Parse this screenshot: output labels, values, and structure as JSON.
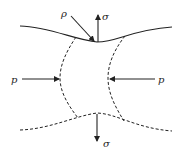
{
  "diagram": {
    "labels": {
      "rho": "ρ",
      "sigma_top": "σ",
      "sigma_bottom": "σ",
      "p_left": "p",
      "p_right": "p"
    },
    "colors": {
      "stroke": "#222222",
      "background": "#ffffff"
    }
  }
}
